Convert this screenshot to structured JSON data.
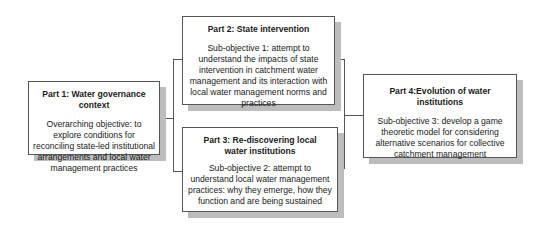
{
  "diagram": {
    "parts": [
      {
        "title": "Part 1: Water governance context",
        "text": "Overarching objective: to explore conditions for reconciling state-led institutional arrangements and local water management practices"
      },
      {
        "title": "Part 2: State intervention",
        "text": "Sub-objective 1: attempt to understand the impacts of state intervention in catchment water management and its interaction with local water management norms and practices"
      },
      {
        "title": "Part 3: Re-discovering local water institutions",
        "text": "Sub-objective 2: attempt to understand local water management practices: why they emerge, how they function and are being sustained"
      },
      {
        "title": "Part 4:Evolution of water institutions",
        "text": "Sub-objective 3: develop a game theoretic model for considering alternative scenarios for collective catchment management"
      }
    ],
    "colors": {
      "border": "#555555",
      "shadow": "#bdbdbd",
      "background": "#ffffff"
    }
  }
}
